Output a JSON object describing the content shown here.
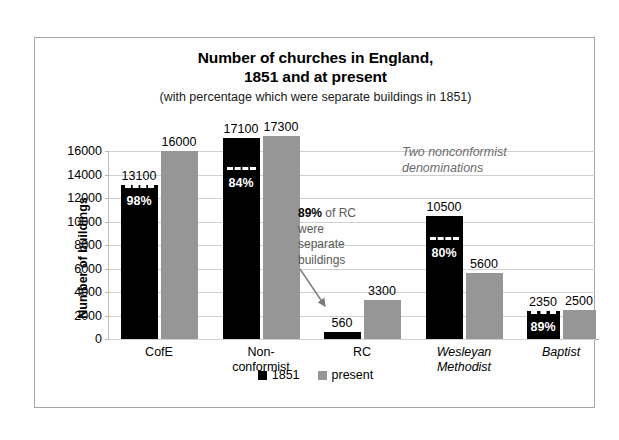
{
  "chart_data": {
    "type": "bar",
    "title": "Number of churches in England,\n1851 and at present",
    "title_line1": "Number of churches in England,",
    "title_line2": "1851 and at present",
    "subtitle": "(with percentage which were separate buildings in 1851)",
    "xlabel": "",
    "ylabel": "Number of buildings",
    "ylim": [
      0,
      16000
    ],
    "ytick_step": 2000,
    "yticks": [
      0,
      2000,
      4000,
      6000,
      8000,
      10000,
      12000,
      14000,
      16000
    ],
    "ytick_labels": [
      "0",
      "2000",
      "4000",
      "6000",
      "8000",
      "10000",
      "12000",
      "14000",
      "16000"
    ],
    "grid": true,
    "legend_position": "bottom",
    "categories": [
      "CofE",
      "Non-conformist",
      "RC",
      "Wesleyan Methodist",
      "Baptist"
    ],
    "category_labels": [
      {
        "lines": [
          "CofE"
        ],
        "italic": false
      },
      {
        "lines": [
          "Non-",
          "conformist"
        ],
        "italic": false
      },
      {
        "lines": [
          "RC"
        ],
        "italic": false
      },
      {
        "lines": [
          "Wesleyan",
          "Methodist"
        ],
        "italic": true
      },
      {
        "lines": [
          "Baptist"
        ],
        "italic": true
      }
    ],
    "series": [
      {
        "name": "1851",
        "color": "#000000",
        "values": [
          13100,
          17100,
          560,
          10500,
          2350
        ],
        "value_labels": [
          "13100",
          "17100",
          "560",
          "10500",
          "2350"
        ],
        "percent_labels": [
          "98%",
          "84%",
          "",
          "80%",
          "89%"
        ],
        "percent_values": [
          98,
          84,
          89,
          80,
          89
        ]
      },
      {
        "name": "present",
        "color": "#969696",
        "values": [
          16000,
          17300,
          3300,
          5600,
          2500
        ],
        "value_labels": [
          "16000",
          "17300",
          "3300",
          "5600",
          "2500"
        ],
        "percent_labels": [
          "",
          "",
          "",
          "",
          ""
        ],
        "percent_values": [
          null,
          null,
          null,
          null,
          null
        ]
      }
    ],
    "annotations": [
      {
        "id": "rc-note",
        "text": "89% of RC were separate buildings",
        "bold_part": "89%",
        "rest_part": "% of RC",
        "lines": [
          "89% of RC",
          "were",
          "separate",
          "buildings"
        ],
        "has_arrow": true,
        "color": "#595959"
      },
      {
        "id": "nonconformist-note",
        "text": "Two nonconformist denominations",
        "lines": [
          "Two nonconformist",
          "denominations"
        ],
        "italic": true,
        "color": "#6b6b6b"
      }
    ],
    "legend_entries": [
      {
        "label": "1851",
        "color": "#000000"
      },
      {
        "label": "present",
        "color": "#969696"
      }
    ]
  },
  "colors": {
    "series_1851": "#000000",
    "series_present": "#969696",
    "gridline": "#d0d0d0",
    "frame_border": "#a6a6a6",
    "annotation_gray": "#595959",
    "note_gray": "#6b6b6b",
    "background": "#ffffff"
  }
}
